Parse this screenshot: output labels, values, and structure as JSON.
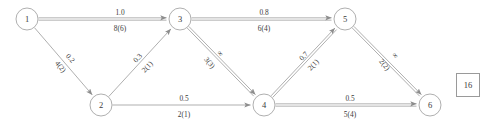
{
  "figure": {
    "type": "network-flow-diagram",
    "stroke_color": "#8d8d8d",
    "text_color": "#3a3a3a",
    "node_radius": 11
  },
  "nodes": [
    {
      "id": "1",
      "label": "1",
      "x": 27,
      "y": 19
    },
    {
      "id": "2",
      "label": "2",
      "x": 101,
      "y": 105
    },
    {
      "id": "3",
      "label": "3",
      "x": 180,
      "y": 19
    },
    {
      "id": "4",
      "label": "4",
      "x": 264,
      "y": 105
    },
    {
      "id": "5",
      "label": "5",
      "x": 345,
      "y": 19
    },
    {
      "id": "6",
      "label": "6",
      "x": 430,
      "y": 105
    }
  ],
  "edges": [
    {
      "id": "e13",
      "from": "1",
      "to": "3",
      "cost": "1.0",
      "capacity": "8(6)",
      "double": true,
      "orientation": "horizontal",
      "lx": 120,
      "ly": 19,
      "rot": 0,
      "above_dy": -7,
      "below_dy": 9
    },
    {
      "id": "e12",
      "from": "1",
      "to": "2",
      "cost": "0.2",
      "capacity": "4(2)",
      "double": false,
      "orientation": "diagonal-down",
      "lx": 66,
      "ly": 62,
      "rot": 49,
      "above_dy": -6,
      "below_dy": 7
    },
    {
      "id": "e23",
      "from": "2",
      "to": "3",
      "cost": "0.3",
      "capacity": "2(1)",
      "double": false,
      "orientation": "diagonal-up",
      "lx": 142,
      "ly": 62,
      "rot": -47,
      "above_dy": -6,
      "below_dy": 7
    },
    {
      "id": "e35",
      "from": "3",
      "to": "5",
      "cost": "0.8",
      "capacity": "6(4)",
      "double": true,
      "orientation": "horizontal",
      "lx": 264,
      "ly": 19,
      "rot": 0,
      "above_dy": -7,
      "below_dy": 9
    },
    {
      "id": "e34",
      "from": "3",
      "to": "4",
      "cost": "∞",
      "capacity": "3(3)",
      "double": true,
      "orientation": "diagonal-down",
      "lx": 215,
      "ly": 58,
      "rot": 49,
      "above_dy": -7,
      "below_dy": 7
    },
    {
      "id": "e24",
      "from": "2",
      "to": "4",
      "cost": "0.5",
      "capacity": "2(1)",
      "double": false,
      "orientation": "horizontal",
      "lx": 184,
      "ly": 105,
      "rot": 0,
      "above_dy": -7,
      "below_dy": 9
    },
    {
      "id": "e45",
      "from": "4",
      "to": "5",
      "cost": "0.7",
      "capacity": "2(1)",
      "double": true,
      "orientation": "diagonal-up",
      "lx": 308,
      "ly": 60,
      "rot": -47,
      "above_dy": -6,
      "below_dy": 7
    },
    {
      "id": "e56",
      "from": "5",
      "to": "6",
      "cost": "∞",
      "capacity": "2(2)",
      "double": true,
      "orientation": "diagonal-down",
      "lx": 390,
      "ly": 60,
      "rot": 49,
      "above_dy": -7,
      "below_dy": 7
    },
    {
      "id": "e46",
      "from": "4",
      "to": "6",
      "cost": "0.5",
      "capacity": "5(4)",
      "double": true,
      "orientation": "horizontal",
      "lx": 350,
      "ly": 105,
      "rot": 0,
      "above_dy": -7,
      "below_dy": 9
    }
  ],
  "annotation_box": {
    "value": "16",
    "x": 456,
    "y": 73,
    "width": 22,
    "height": 22
  }
}
